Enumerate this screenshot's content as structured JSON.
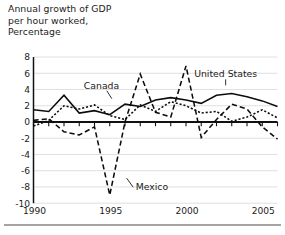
{
  "title": {
    "lines": [
      "Annual growth of GDP",
      "per hour worked,",
      "Percentage"
    ]
  },
  "chart_data": {
    "type": "line",
    "title": "Annual growth of GDP per hour worked, Percentage",
    "xlabel": "",
    "ylabel": "Percentage",
    "xlim": [
      1990,
      2006
    ],
    "ylim": [
      -10,
      8
    ],
    "ytick_step": 2,
    "yticks": [
      8,
      6,
      4,
      2,
      0,
      -2,
      -4,
      -6,
      -8,
      -10
    ],
    "ytick_labels": [
      "8",
      "6",
      "4",
      "2",
      "0",
      "-2",
      "-4",
      "-6",
      "-8",
      "-10"
    ],
    "xticks": [
      1990,
      1995,
      2000,
      2005
    ],
    "xtick_labels": [
      "1990",
      "1995",
      "2000",
      "2005"
    ],
    "x": [
      1990,
      1991,
      1992,
      1993,
      1994,
      1995,
      1996,
      1997,
      1998,
      1999,
      2000,
      2001,
      2002,
      2003,
      2004,
      2005,
      2006
    ],
    "grid": "horizontal",
    "legend_position": "inline-annotations",
    "series": [
      {
        "name": "United States",
        "style": "solid",
        "color": "#0d0d0d",
        "values": [
          1.5,
          1.3,
          3.3,
          1.1,
          1.4,
          0.9,
          2.2,
          1.9,
          2.7,
          3.0,
          2.7,
          2.3,
          3.3,
          3.5,
          3.1,
          2.6,
          1.9
        ]
      },
      {
        "name": "Canada",
        "style": "dotted",
        "color": "#0d0d0d",
        "values": [
          -0.5,
          0.2,
          2.0,
          1.6,
          2.1,
          0.8,
          0.3,
          2.1,
          1.3,
          2.5,
          2.0,
          1.1,
          1.3,
          0.1,
          0.6,
          1.5,
          0.5
        ]
      },
      {
        "name": "Mexico",
        "style": "dashed",
        "color": "#0d0d0d",
        "values": [
          0.2,
          0.4,
          -1.2,
          -1.6,
          -0.6,
          -9.0,
          0.0,
          5.9,
          1.2,
          0.6,
          6.9,
          -1.9,
          0.3,
          2.2,
          1.6,
          -0.6,
          -2.1
        ]
      }
    ],
    "annotations": [
      {
        "text": "Canada",
        "series": "Canada",
        "x": 1993.3,
        "y": 4.1
      },
      {
        "text": "United States",
        "series": "United States",
        "x": 2002.6,
        "y": 5.5
      },
      {
        "text": "Mexico",
        "series": "Mexico",
        "x": 1996.7,
        "y": -8.4
      }
    ]
  }
}
